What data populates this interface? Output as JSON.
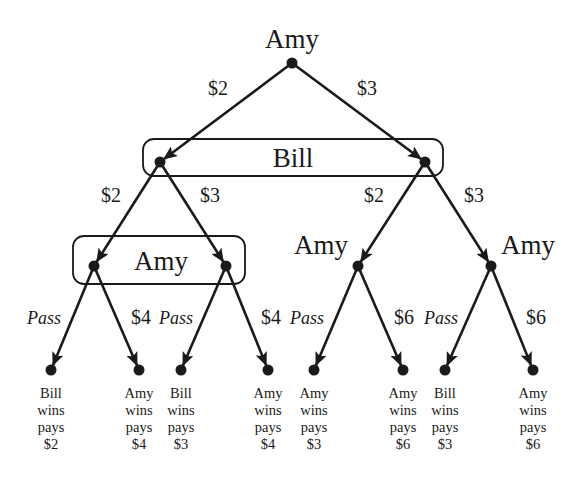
{
  "diagram": {
    "type": "game-tree",
    "root": {
      "id": "n0",
      "player": "Amy",
      "x": 292,
      "y": 63,
      "label_x": 292,
      "label_y": 48
    },
    "info_sets": [
      {
        "id": "is_bill",
        "player": "Bill",
        "x": 143,
        "y": 139,
        "w": 300,
        "h": 37,
        "label_x": 293,
        "label_y": 167,
        "nodes": [
          "n1",
          "n2"
        ]
      },
      {
        "id": "is_amy",
        "player": "Amy",
        "x": 73,
        "y": 236,
        "w": 172,
        "h": 48,
        "label_x": 161,
        "label_y": 270,
        "nodes": [
          "n3",
          "n4"
        ]
      }
    ],
    "decision_nodes": [
      {
        "id": "n1",
        "x": 160,
        "y": 162
      },
      {
        "id": "n2",
        "x": 425,
        "y": 162
      },
      {
        "id": "n3",
        "x": 94,
        "y": 266
      },
      {
        "id": "n4",
        "x": 226,
        "y": 266
      },
      {
        "id": "n5",
        "player": "Amy",
        "x": 358,
        "y": 266,
        "label_x": 321,
        "label_y": 254
      },
      {
        "id": "n6",
        "player": "Amy",
        "x": 491,
        "y": 266,
        "label_x": 528,
        "label_y": 254
      }
    ],
    "edges": [
      {
        "from": "n0",
        "to": "n1",
        "label": "$2",
        "label_x": 218,
        "label_y": 95,
        "italic": false
      },
      {
        "from": "n0",
        "to": "n2",
        "label": "$3",
        "label_x": 367,
        "label_y": 95,
        "italic": false
      },
      {
        "from": "n1",
        "to": "n3",
        "label": "$2",
        "label_x": 111,
        "label_y": 202,
        "italic": false
      },
      {
        "from": "n1",
        "to": "n4",
        "label": "$3",
        "label_x": 210,
        "label_y": 202,
        "italic": false
      },
      {
        "from": "n2",
        "to": "n5",
        "label": "$2",
        "label_x": 374,
        "label_y": 202,
        "italic": false
      },
      {
        "from": "n2",
        "to": "n6",
        "label": "$3",
        "label_x": 474,
        "label_y": 202,
        "italic": false
      },
      {
        "from": "n3",
        "to": "l1",
        "label": "Pass",
        "label_x": 44,
        "label_y": 324,
        "italic": true
      },
      {
        "from": "n3",
        "to": "l2",
        "label": "$4",
        "label_x": 141,
        "label_y": 324,
        "italic": false
      },
      {
        "from": "n4",
        "to": "l3",
        "label": "Pass",
        "label_x": 176,
        "label_y": 324,
        "italic": true
      },
      {
        "from": "n4",
        "to": "l4",
        "label": "$4",
        "label_x": 271,
        "label_y": 324,
        "italic": false
      },
      {
        "from": "n5",
        "to": "l5",
        "label": "Pass",
        "label_x": 307,
        "label_y": 324,
        "italic": true
      },
      {
        "from": "n5",
        "to": "l6",
        "label": "$6",
        "label_x": 404,
        "label_y": 324,
        "italic": false
      },
      {
        "from": "n6",
        "to": "l7",
        "label": "Pass",
        "label_x": 441,
        "label_y": 324,
        "italic": true
      },
      {
        "from": "n6",
        "to": "l8",
        "label": "$6",
        "label_x": 536,
        "label_y": 324,
        "italic": false
      }
    ],
    "leaves": [
      {
        "id": "l1",
        "x": 51,
        "y": 370,
        "winner": "Bill",
        "line2": "wins",
        "line3": "pays",
        "amount": "$2"
      },
      {
        "id": "l2",
        "x": 139,
        "y": 370,
        "winner": "Amy",
        "line2": "wins",
        "line3": "pays",
        "amount": "$4"
      },
      {
        "id": "l3",
        "x": 181,
        "y": 370,
        "winner": "Bill",
        "line2": "wins",
        "line3": "pays",
        "amount": "$3"
      },
      {
        "id": "l4",
        "x": 268,
        "y": 370,
        "winner": "Amy",
        "line2": "wins",
        "line3": "pays",
        "amount": "$4"
      },
      {
        "id": "l5",
        "x": 314,
        "y": 370,
        "winner": "Amy",
        "line2": "wins",
        "line3": "pays",
        "amount": "$3"
      },
      {
        "id": "l6",
        "x": 403,
        "y": 370,
        "winner": "Amy",
        "line2": "wins",
        "line3": "pays",
        "amount": "$6"
      },
      {
        "id": "l7",
        "x": 445,
        "y": 370,
        "winner": "Bill",
        "line2": "wins",
        "line3": "pays",
        "amount": "$3"
      },
      {
        "id": "l8",
        "x": 533,
        "y": 370,
        "winner": "Amy",
        "line2": "wins",
        "line3": "pays",
        "amount": "$6"
      }
    ]
  },
  "colors": {
    "ink": "#1a1a1a",
    "background": "#ffffff"
  }
}
